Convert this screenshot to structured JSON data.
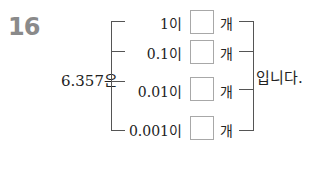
{
  "problem": {
    "number": "16",
    "lead_text": "6.357은",
    "rows": [
      {
        "label": "1이",
        "answer": "",
        "unit": "개"
      },
      {
        "label": "0.1이",
        "answer": "",
        "unit": "개"
      },
      {
        "label": "0.01이",
        "answer": "",
        "unit": "개"
      },
      {
        "label": "0.001이",
        "answer": "",
        "unit": "개"
      }
    ],
    "tail_text": "입니다."
  }
}
